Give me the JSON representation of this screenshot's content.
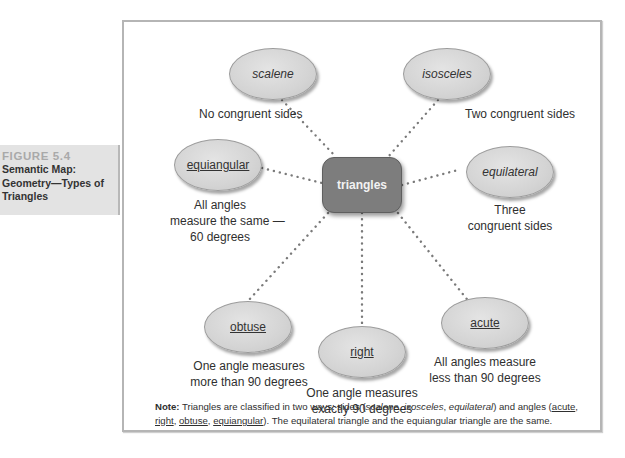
{
  "figure": {
    "number": "FIGURE 5.4",
    "title_line1": "Semantic Map:",
    "title_line2": "Geometry—Types of",
    "title_line3": "Triangles"
  },
  "center": {
    "label": "triangles",
    "color": "#7d7d7d"
  },
  "nodes": [
    {
      "id": "scalene",
      "label": "scalene",
      "style": "italic",
      "category": "sides",
      "description": [
        "No congruent sides"
      ]
    },
    {
      "id": "isosceles",
      "label": "isosceles",
      "style": "italic",
      "category": "sides",
      "description": [
        "Two congruent sides"
      ]
    },
    {
      "id": "equiangular",
      "label": "equiangular",
      "style": "underline",
      "category": "angles",
      "description": [
        "All angles",
        "measure the same —",
        "60 degrees"
      ]
    },
    {
      "id": "equilateral",
      "label": "equilateral",
      "style": "italic",
      "category": "sides",
      "description": [
        "Three",
        "congruent sides"
      ]
    },
    {
      "id": "obtuse",
      "label": "obtuse",
      "style": "underline",
      "category": "angles",
      "description": [
        "One angle measures",
        "more than 90 degrees"
      ]
    },
    {
      "id": "right",
      "label": "right",
      "style": "underline",
      "category": "angles",
      "description": [
        "One angle measures",
        "exactly 90 degrees"
      ]
    },
    {
      "id": "acute",
      "label": "acute",
      "style": "underline",
      "category": "angles",
      "description": [
        "All angles measure",
        "less than 90 degrees"
      ]
    }
  ],
  "note": {
    "label": "Note:",
    "text_1": " Triangles are classified in two ways: sides (",
    "sides": [
      "scalene",
      "isosceles",
      "equilateral"
    ],
    "text_2": ") and angles (",
    "angles": [
      "acute",
      "right",
      "obtuse",
      "equiangular"
    ],
    "text_3": "). The equilateral triangle and the equiangular triangle are the same.",
    "sep": ", "
  }
}
